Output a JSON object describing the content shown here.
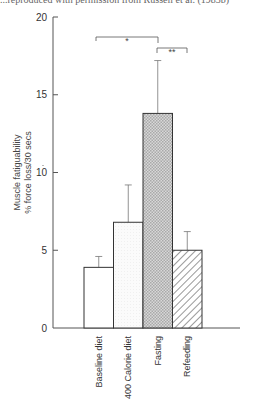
{
  "caption": "...reproduced with permission from Russell et al. (1983b)",
  "chart_data": {
    "type": "bar",
    "title": "",
    "xlabel": "",
    "ylabel": "Muscle fatiguability\n% force loss/30 secs",
    "ylabel_lines": [
      "Muscle fatiguability",
      "% force loss/30 secs"
    ],
    "ylim": [
      0,
      20
    ],
    "yticks": [
      0,
      5,
      10,
      15,
      20
    ],
    "grid": false,
    "categories": [
      "Baseline diet",
      "400 Calorie diet",
      "Fasting",
      "Refeeding"
    ],
    "values": [
      3.9,
      6.8,
      13.8,
      5.0
    ],
    "error_upper": [
      4.6,
      9.2,
      17.2,
      6.2
    ],
    "fills": [
      "white",
      "dotted-light",
      "crosshatch-gray",
      "diagonal-hatch"
    ],
    "annotations": [
      {
        "label": "*",
        "from": "Baseline diet",
        "to": "Fasting",
        "y": 18.7
      },
      {
        "label": "**",
        "from": "Fasting",
        "to": "Refeeding",
        "y": 18.0
      }
    ]
  }
}
